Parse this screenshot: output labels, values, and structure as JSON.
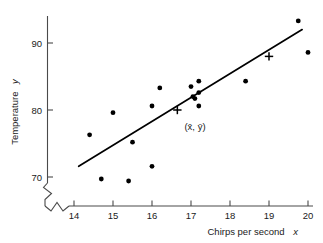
{
  "figure": {
    "name": "chirps-temperature-scatterplot",
    "background_color": "#ffffff",
    "ink_color": "#000000",
    "axis_color": "#4a4a4a"
  },
  "axes": {
    "x": {
      "title_main": "Chirps per second",
      "title_var": "x",
      "ticks": [
        "14",
        "15",
        "16",
        "17",
        "18",
        "19",
        "20"
      ],
      "min": 14,
      "max": 20,
      "has_break": true
    },
    "y": {
      "title_main": "Temperature",
      "title_var": "y",
      "ticks": [
        "70",
        "80",
        "90"
      ],
      "min": 70,
      "max": 90,
      "has_break": true
    }
  },
  "annotations": {
    "centroid_label": "(x̄, ȳ)",
    "centroid_label_plain": "(x-bar, y-bar)"
  },
  "chart_data": {
    "type": "scatter",
    "title": "",
    "xlabel": "Chirps per second x",
    "ylabel": "Temperature y",
    "xlim": [
      13.7,
      20.3
    ],
    "ylim": [
      68.5,
      94.6
    ],
    "xticks": [
      14,
      15,
      16,
      17,
      18,
      19,
      20
    ],
    "yticks": [
      70,
      80,
      90
    ],
    "grid": false,
    "legend": null,
    "axis_break_x": true,
    "axis_break_y": true,
    "points": [
      {
        "x": 14.4,
        "y": 76.3
      },
      {
        "x": 14.7,
        "y": 69.7
      },
      {
        "x": 15.0,
        "y": 79.6
      },
      {
        "x": 15.4,
        "y": 69.4
      },
      {
        "x": 15.5,
        "y": 75.2
      },
      {
        "x": 16.0,
        "y": 71.6
      },
      {
        "x": 16.0,
        "y": 80.6
      },
      {
        "x": 16.2,
        "y": 83.3
      },
      {
        "x": 17.0,
        "y": 83.5
      },
      {
        "x": 17.05,
        "y": 82.0
      },
      {
        "x": 17.1,
        "y": 81.7
      },
      {
        "x": 17.2,
        "y": 84.3
      },
      {
        "x": 17.2,
        "y": 82.6
      },
      {
        "x": 17.2,
        "y": 80.6
      },
      {
        "x": 18.4,
        "y": 84.3
      },
      {
        "x": 19.75,
        "y": 93.3
      },
      {
        "x": 20.0,
        "y": 88.6
      }
    ],
    "cross_markers": [
      {
        "x": 16.65,
        "y": 80.0,
        "label": "(x̄, ȳ)"
      },
      {
        "x": 19.0,
        "y": 88.0,
        "label": ""
      }
    ],
    "fit_line": {
      "type": "linear-regression",
      "x_start": 14.12,
      "y_start": 71.6,
      "x_end": 19.85,
      "y_end": 92.0
    }
  }
}
